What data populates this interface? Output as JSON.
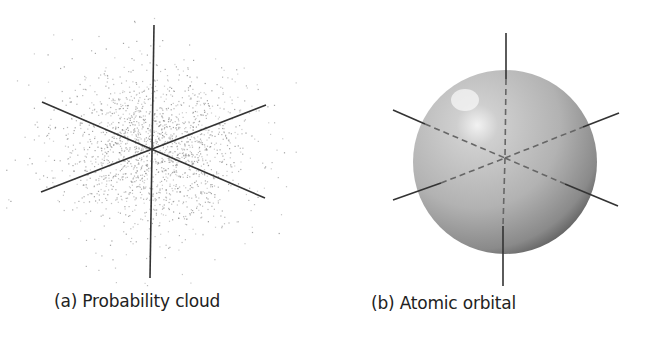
{
  "panels": [
    {
      "id": "a",
      "caption": "(a)  Probability cloud",
      "kind": "probability-cloud",
      "center": [
        151,
        150
      ]
    },
    {
      "id": "b",
      "caption": "(b)  Atomic orbital",
      "kind": "spherical-orbital",
      "center": [
        505,
        160
      ],
      "radius": 92
    }
  ],
  "colors": {
    "axis": "#333333",
    "dots": "#888888",
    "sphere_light": "#e8e8e8",
    "sphere_dark": "#6a6a6a"
  }
}
